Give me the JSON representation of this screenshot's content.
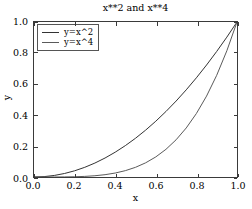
{
  "chart_data": {
    "type": "line",
    "title": "x**2 and x**4",
    "xlabel": "x",
    "ylabel": "y",
    "xlim": [
      0.0,
      1.0
    ],
    "ylim": [
      0.0,
      1.0
    ],
    "grid": false,
    "legend_position": "upper left",
    "xticks": [
      "0.0",
      "0.2",
      "0.4",
      "0.6",
      "0.8",
      "1.0"
    ],
    "xtick_values": [
      0.0,
      0.2,
      0.4,
      0.6,
      0.8,
      1.0
    ],
    "yticks": [
      "0.0",
      "0.2",
      "0.4",
      "0.6",
      "0.8",
      "1.0"
    ],
    "ytick_values": [
      0.0,
      0.2,
      0.4,
      0.6,
      0.8,
      1.0
    ],
    "x": [
      0.0,
      0.05,
      0.1,
      0.15,
      0.2,
      0.25,
      0.3,
      0.35,
      0.4,
      0.45,
      0.5,
      0.55,
      0.6,
      0.65,
      0.7,
      0.75,
      0.8,
      0.85,
      0.9,
      0.95,
      1.0
    ],
    "series": [
      {
        "name": "y=x^2",
        "color": "#333333",
        "linewidth": 1,
        "values": [
          0.0,
          0.0025,
          0.01,
          0.0225,
          0.04,
          0.0625,
          0.09,
          0.1225,
          0.16,
          0.2025,
          0.25,
          0.3025,
          0.36,
          0.4225,
          0.49,
          0.5625,
          0.64,
          0.7225,
          0.81,
          0.9025,
          1.0
        ]
      },
      {
        "name": "y=x^4",
        "color": "#5a5a5a",
        "linewidth": 1,
        "values": [
          0.0,
          6.25e-06,
          0.0001,
          0.00050625,
          0.0016,
          0.00390625,
          0.0081,
          0.01500625,
          0.0256,
          0.04100625,
          0.0625,
          0.09150625,
          0.1296,
          0.17850625,
          0.2401,
          0.31640625,
          0.4096,
          0.52200625,
          0.6561,
          0.81450625,
          1.0
        ]
      }
    ]
  },
  "legend": {
    "entries": [
      {
        "label": "y=x^2",
        "color": "#333333"
      },
      {
        "label": "y=x^4",
        "color": "#5a5a5a"
      }
    ]
  }
}
